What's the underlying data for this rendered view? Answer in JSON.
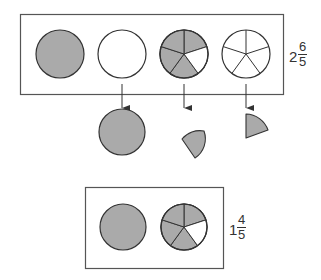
{
  "diagram": {
    "title": "",
    "colors": {
      "shaded": "#aaaaaa",
      "empty": "#ffffff",
      "stroke": "#333333"
    },
    "top_group": {
      "label": {
        "whole": "2",
        "numerator": "6",
        "denominator": "5"
      },
      "circles": [
        {
          "type": "whole",
          "shaded": true
        },
        {
          "type": "whole",
          "shaded": false
        },
        {
          "type": "pie",
          "slices": 5,
          "shaded_slices": 4
        },
        {
          "type": "pie",
          "slices": 5,
          "shaded_slices": 0
        }
      ]
    },
    "arrows": 3,
    "middle_row": [
      {
        "type": "whole",
        "shaded": true,
        "description": "1 whole formed"
      },
      {
        "type": "wedge",
        "fraction": "1/5"
      },
      {
        "type": "wedge",
        "fraction": "1/5"
      }
    ],
    "bottom_group": {
      "label": {
        "whole": "1",
        "numerator": "4",
        "denominator": "5"
      },
      "circles": [
        {
          "type": "whole",
          "shaded": true
        },
        {
          "type": "pie",
          "slices": 5,
          "shaded_slices": 4
        }
      ]
    }
  }
}
